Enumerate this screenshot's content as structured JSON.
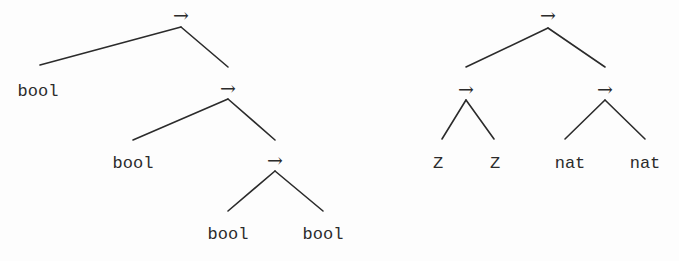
{
  "diagram": {
    "type": "type-trees",
    "trees": [
      {
        "name": "left-tree",
        "nodes": [
          {
            "id": "L1",
            "label": "→",
            "x": 181,
            "y": 22
          },
          {
            "id": "L2",
            "label": "→",
            "x": 228,
            "y": 95
          },
          {
            "id": "L3",
            "label": "→",
            "x": 275,
            "y": 167
          }
        ],
        "leaves": [
          {
            "id": "L1a",
            "label": "bool",
            "x": 38,
            "y": 96
          },
          {
            "id": "L2a",
            "label": "bool",
            "x": 133,
            "y": 168
          },
          {
            "id": "L3a",
            "label": "bool",
            "x": 228,
            "y": 239
          },
          {
            "id": "L3b",
            "label": "bool",
            "x": 323,
            "y": 239
          }
        ],
        "edges": [
          {
            "from": [
              181,
              27
            ],
            "to": [
              40,
              65
            ]
          },
          {
            "from": [
              181,
              27
            ],
            "to": [
              228,
              67
            ]
          },
          {
            "from": [
              228,
              99
            ],
            "to": [
              133,
              140
            ]
          },
          {
            "from": [
              228,
              99
            ],
            "to": [
              275,
              140
            ]
          },
          {
            "from": [
              275,
              171
            ],
            "to": [
              228,
              211
            ]
          },
          {
            "from": [
              275,
              171
            ],
            "to": [
              323,
              211
            ]
          }
        ]
      },
      {
        "name": "right-tree",
        "nodes": [
          {
            "id": "R1",
            "label": "→",
            "x": 548,
            "y": 22
          },
          {
            "id": "R2",
            "label": "→",
            "x": 466,
            "y": 96
          },
          {
            "id": "R3",
            "label": "→",
            "x": 605,
            "y": 96
          }
        ],
        "leaves": [
          {
            "id": "R2a",
            "label": "Z",
            "x": 438,
            "y": 168
          },
          {
            "id": "R2b",
            "label": "Z",
            "x": 495,
            "y": 168
          },
          {
            "id": "R3a",
            "label": "nat",
            "x": 570,
            "y": 168
          },
          {
            "id": "R3b",
            "label": "nat",
            "x": 645,
            "y": 168
          }
        ],
        "edges": [
          {
            "from": [
              548,
              28
            ],
            "to": [
              466,
              67
            ]
          },
          {
            "from": [
              548,
              28
            ],
            "to": [
              605,
              67
            ]
          },
          {
            "from": [
              466,
              100
            ],
            "to": [
              442,
              139
            ]
          },
          {
            "from": [
              466,
              100
            ],
            "to": [
              494,
              139
            ]
          },
          {
            "from": [
              605,
              100
            ],
            "to": [
              565,
              139
            ]
          },
          {
            "from": [
              605,
              100
            ],
            "to": [
              645,
              139
            ]
          }
        ]
      }
    ]
  },
  "labels": {
    "arrow": "→",
    "bool": "bool",
    "z": "Z",
    "nat": "nat"
  }
}
